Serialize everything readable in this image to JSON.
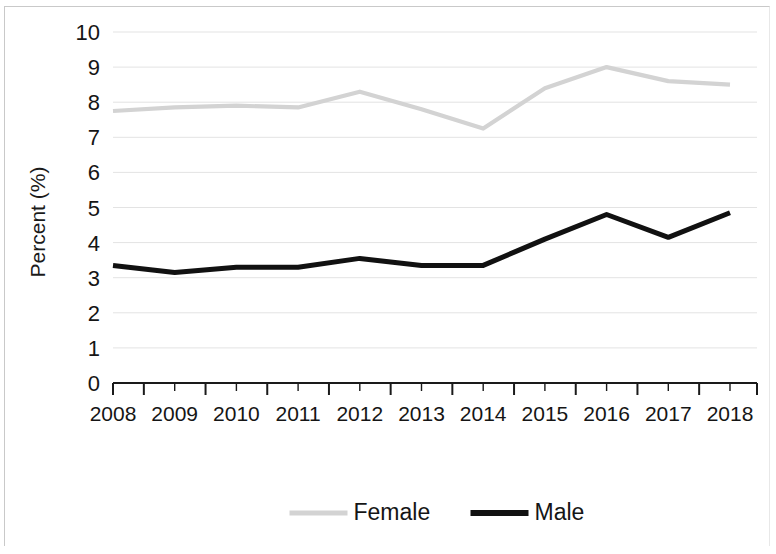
{
  "chart_data": {
    "type": "line",
    "title": "",
    "xlabel": "",
    "ylabel": "Percent (%)",
    "categories": [
      "2008",
      "2009",
      "2010",
      "2011",
      "2012",
      "2013",
      "2014",
      "2015",
      "2016",
      "2017",
      "2018"
    ],
    "ylim": [
      0,
      10
    ],
    "ytick_step": 1,
    "yticks": [
      "0",
      "1",
      "2",
      "3",
      "4",
      "5",
      "6",
      "7",
      "8",
      "9",
      "10"
    ],
    "grid": "horizontal",
    "legend_position": "bottom",
    "minor_xticks": true,
    "series": [
      {
        "name": "Female",
        "color": "#d3d3d3",
        "values": [
          7.75,
          7.85,
          7.9,
          7.85,
          8.3,
          7.8,
          7.25,
          8.4,
          9.0,
          8.6,
          8.5
        ]
      },
      {
        "name": "Male",
        "color": "#111111",
        "values": [
          3.35,
          3.15,
          3.3,
          3.3,
          3.55,
          3.35,
          3.35,
          4.1,
          4.8,
          4.15,
          4.85
        ]
      }
    ]
  },
  "axis": {
    "y_label": "Percent (%)"
  },
  "legend": {
    "items": [
      {
        "label": "Female",
        "color": "#d3d3d3"
      },
      {
        "label": "Male",
        "color": "#111111"
      }
    ]
  }
}
